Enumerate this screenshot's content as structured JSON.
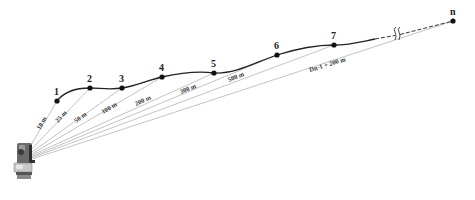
{
  "diagram": {
    "type": "survey-traverse",
    "instrument": {
      "icon": "total-station-icon",
      "x": 24,
      "y": 157
    },
    "points": [
      {
        "label": "1",
        "x": 57,
        "y": 101
      },
      {
        "label": "2",
        "x": 90,
        "y": 88
      },
      {
        "label": "3",
        "x": 122,
        "y": 88
      },
      {
        "label": "4",
        "x": 162,
        "y": 77
      },
      {
        "label": "5",
        "x": 214,
        "y": 73
      },
      {
        "label": "6",
        "x": 277,
        "y": 55
      },
      {
        "label": "7",
        "x": 334,
        "y": 45
      },
      {
        "label": "n",
        "x": 453,
        "y": 21
      }
    ],
    "distances": [
      {
        "label": "10 m",
        "to": "1"
      },
      {
        "label": "25 m",
        "to": "2"
      },
      {
        "label": "50 m",
        "to": "3"
      },
      {
        "label": "100 m",
        "to": "4"
      },
      {
        "label": "200 m",
        "to": "5"
      },
      {
        "label": "300 m",
        "to": "6"
      },
      {
        "label": "500 m",
        "to": "7"
      },
      {
        "label": "Dn-1 + 200 m",
        "to": "n"
      }
    ],
    "break_symbol": "//"
  },
  "labels": {
    "p1": "1",
    "p2": "2",
    "p3": "3",
    "p4": "4",
    "p5": "5",
    "p6": "6",
    "p7": "7",
    "pn": "n",
    "d1": "10 m",
    "d2": "25 m",
    "d3": "50 m",
    "d4": "100 m",
    "d5": "200 m",
    "d6": "300 m",
    "d7": "500 m",
    "dn": "Dn-1 + 200 m"
  }
}
